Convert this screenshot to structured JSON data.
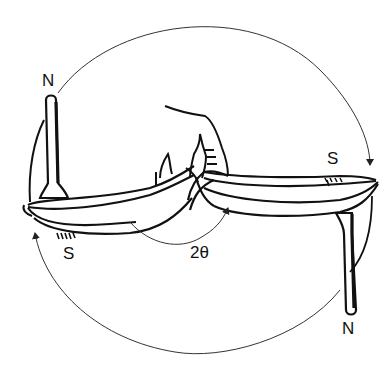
{
  "diagram": {
    "labels": {
      "left_top": "N",
      "left_bottom": "S",
      "right_top": "S",
      "right_bottom": "N",
      "angle": "2θ"
    },
    "colors": {
      "stroke": "#111111",
      "thin_stroke": "#333333",
      "background": "#ffffff"
    }
  }
}
